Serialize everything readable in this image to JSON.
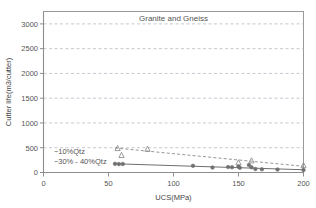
{
  "chart_data": {
    "type": "scatter",
    "title": "Granite and Gneiss",
    "xlabel": "UCS(MPa)",
    "ylabel": "Cutter life(m3/cutter)",
    "xlim": [
      0,
      200
    ],
    "ylim": [
      0,
      3250
    ],
    "xticks": [
      0,
      50,
      100,
      150,
      200
    ],
    "xtick_labels": [
      "0",
      "50",
      "100",
      "150",
      "200"
    ],
    "yticks": [
      0,
      500,
      1000,
      1500,
      2000,
      2500,
      3000
    ],
    "ytick_labels": [
      "0",
      "500",
      "1000",
      "1500",
      "2000",
      "2500",
      "3000"
    ],
    "grid": "horizontal-dashed",
    "legend_position": "inline-annotation",
    "annotations": [
      {
        "text": "~10%Qtz",
        "x": 8,
        "y": 430
      },
      {
        "text": "~30% - 40%Qtz",
        "x": 8,
        "y": 215
      }
    ],
    "series": [
      {
        "name": "~10%Qtz",
        "marker": "triangle-open",
        "line": "dashed",
        "color": "#8a8a8a",
        "points": [
          {
            "x": 57,
            "y": 495
          },
          {
            "x": 60,
            "y": 355
          },
          {
            "x": 80,
            "y": 480
          },
          {
            "x": 150,
            "y": 205
          },
          {
            "x": 160,
            "y": 245
          },
          {
            "x": 200,
            "y": 150
          }
        ],
        "trend": [
          {
            "x": 55,
            "y": 495
          },
          {
            "x": 200,
            "y": 125
          }
        ]
      },
      {
        "name": "~30% - 40%Qtz",
        "marker": "circle-filled",
        "line": "solid",
        "color": "#6f6f6f",
        "points": [
          {
            "x": 55,
            "y": 175
          },
          {
            "x": 58,
            "y": 170
          },
          {
            "x": 61,
            "y": 172
          },
          {
            "x": 115,
            "y": 135
          },
          {
            "x": 130,
            "y": 100
          },
          {
            "x": 142,
            "y": 110
          },
          {
            "x": 145,
            "y": 105
          },
          {
            "x": 150,
            "y": 120
          },
          {
            "x": 151,
            "y": 95
          },
          {
            "x": 158,
            "y": 150
          },
          {
            "x": 160,
            "y": 105
          },
          {
            "x": 163,
            "y": 70
          },
          {
            "x": 168,
            "y": 65
          },
          {
            "x": 180,
            "y": 60
          },
          {
            "x": 200,
            "y": 50
          }
        ],
        "trend": [
          {
            "x": 55,
            "y": 178
          },
          {
            "x": 200,
            "y": 55
          }
        ]
      }
    ]
  }
}
